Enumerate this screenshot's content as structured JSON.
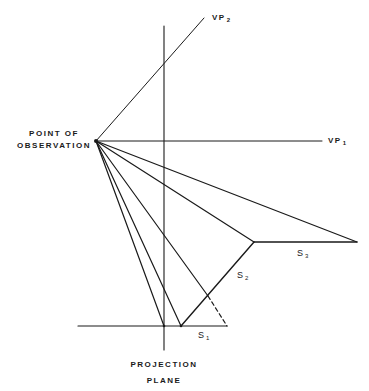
{
  "labels": {
    "point_of_observation_line1": "POINT OF",
    "point_of_observation_line2": "OBSERVATION",
    "vp1_main": "VP",
    "vp1_sub": "1",
    "vp2_main": "VP",
    "vp2_sub": "2",
    "s1_main": "S",
    "s1_sub": "1",
    "s2_main": "S",
    "s2_sub": "2",
    "s3_main": "S",
    "s3_sub": "3",
    "projection_plane_line1": "PROJECTION",
    "projection_plane_line2": "PLANE"
  },
  "colors": {
    "stroke": "#1a1a1a",
    "background": "#ffffff"
  },
  "geometry": {
    "point_of_observation": [
      96,
      141
    ],
    "vp1_end": [
      322,
      141
    ],
    "vp2_end": [
      204,
      18
    ],
    "projection_plane_x": 164,
    "projection_plane_top": 26,
    "projection_plane_bottom": 350,
    "baseline_y": 326,
    "baseline_start_x": 78,
    "s1": [
      [
        181,
        326
      ],
      [
        227,
        326
      ]
    ],
    "s2": [
      [
        181,
        326
      ],
      [
        254,
        242
      ]
    ],
    "s3": [
      [
        254,
        242
      ],
      [
        357,
        242
      ]
    ],
    "dashed": [
      [
        208,
        296
      ],
      [
        227,
        326
      ]
    ],
    "rays_to": [
      [
        164,
        326
      ],
      [
        181,
        326
      ],
      [
        208,
        296
      ],
      [
        254,
        242
      ],
      [
        357,
        242
      ]
    ]
  }
}
